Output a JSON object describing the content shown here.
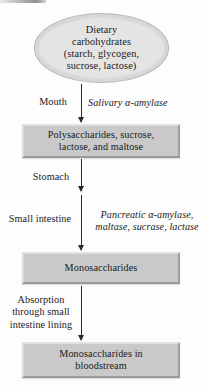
{
  "diagram": {
    "start_node": {
      "shape": "ellipse",
      "lines": [
        "Dietary",
        "carbohydrates",
        "(starch, glycogen,",
        "sucrose, lactose)"
      ]
    },
    "steps": [
      {
        "organ": [
          "Mouth"
        ],
        "enzymes": [
          "Salivary α-amylase"
        ],
        "product": [
          "Polysaccharides, sucrose,",
          "lactose, and maltose"
        ]
      },
      {
        "organ": [
          "Stomach"
        ],
        "enzymes": [],
        "product": []
      },
      {
        "organ": [
          "Small intestine"
        ],
        "enzymes": [
          "Pancreatic α-amylase,",
          "maltase, sucrase, lactase"
        ],
        "product": [
          "Monosaccharides"
        ]
      },
      {
        "organ": [
          "Absorption",
          "through small",
          "intestine lining"
        ],
        "enzymes": [],
        "product": [
          "Monosaccharides in",
          "bloodstream"
        ]
      }
    ],
    "colors": {
      "box_fill": "#c9c9c9",
      "ellipse_fill": "#e4e4e4",
      "arrow": "#2a2a2a",
      "text": "#1a1a1a",
      "background": "#fdfdfd"
    }
  }
}
